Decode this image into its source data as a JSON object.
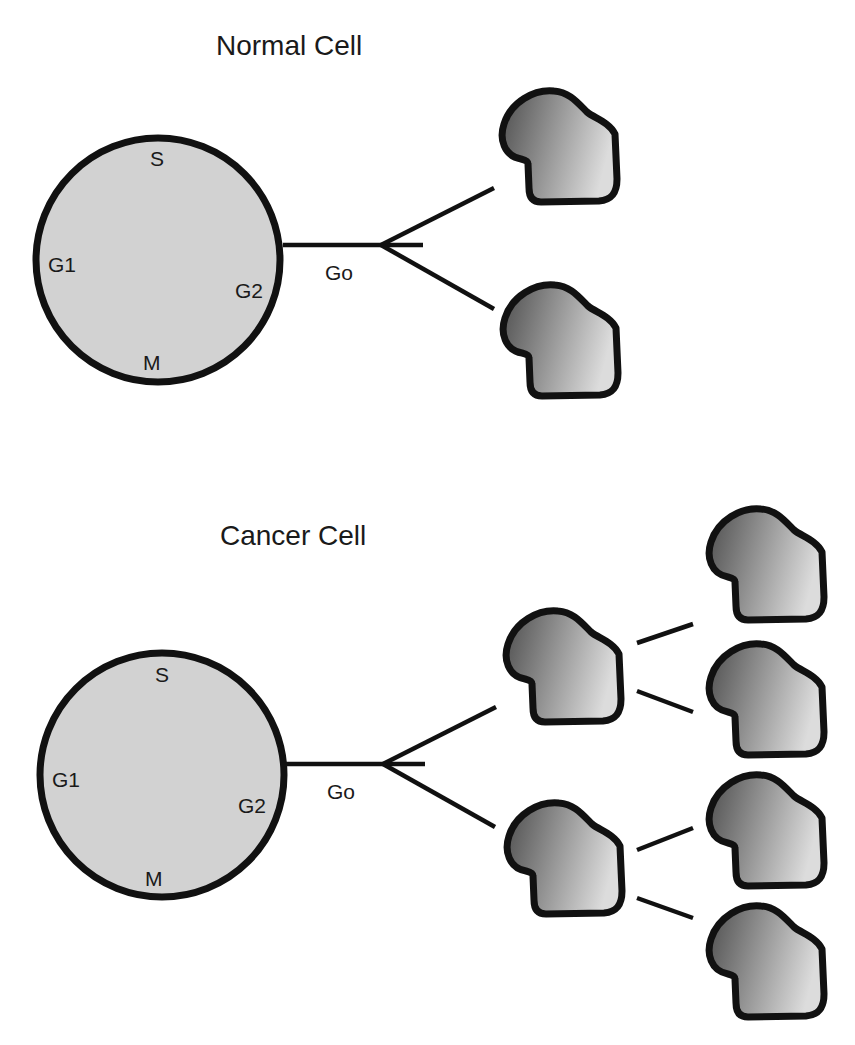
{
  "diagram": {
    "colors": {
      "outline": "#111111",
      "cycle_fill": "#d2d2d2",
      "cell_gradient_dark": "#4e4e4e",
      "cell_gradient_light": "#dcdcdc",
      "background": "#ffffff"
    },
    "normal": {
      "title": "Normal Cell",
      "phases": {
        "s": "S",
        "g1": "G1",
        "g2": "G2",
        "m": "M"
      },
      "exit_label": "Go",
      "daughter_cells": 2
    },
    "cancer": {
      "title": "Cancer Cell",
      "phases": {
        "s": "S",
        "g1": "G1",
        "g2": "G2",
        "m": "M"
      },
      "exit_label": "Go",
      "first_generation_cells": 2,
      "second_generation_cells": 4
    }
  }
}
